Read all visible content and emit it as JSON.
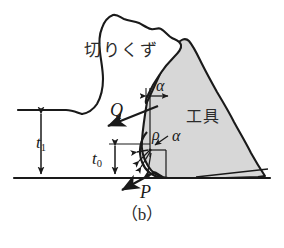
{
  "figure": {
    "caption": "（b）",
    "domain_type": "technical-diagram",
    "background_color": "#ffffff",
    "line_color": "#1a1a1a",
    "tool_fill_color": "#d7d7d7",
    "chip_fill_color": "#ffffff"
  },
  "labels": {
    "chip": "切りくず",
    "tool": "工具",
    "force_Q": "Q",
    "force_P": "P",
    "depth_t1": "t",
    "depth_t1_sub": "1",
    "depth_t0": "t",
    "depth_t0_sub": "0",
    "angle_alpha_top": "α",
    "angle_alpha_mid": "α",
    "radius_rho": "ρ"
  },
  "annotations": {
    "alpha_top_description": "rake angle measured between vertical reference line and tool rake face",
    "alpha_mid_description": "angle at the rounded cutting edge centre",
    "rho_description": "cutting edge nose radius",
    "t1_description": "uncut chip thickness from workpiece top surface to machined surface",
    "t0_description": "depth from tool edge centre height to machined surface",
    "Q_description": "resultant force arrow on the rake face directed up-left",
    "P_description": "force arrow at the cutting edge directed down-left"
  },
  "geometry": {
    "chip_outline": "M 24,116 L 80,116 L 92,112 L 100,100 L 104,82 L 102,60 L 98,38 L 104,22 L 112,14 L 120,18 L 130,20 L 140,24 L 150,26 L 156,32 L 162,30 L 170,36 L 176,38 L 180,44 L 172,52 L 166,60 L 160,68 L 152,78 L 148,90 L 146,100",
    "tool_outline": "M 147,101 L 158,80 L 168,58 L 178,44 L 186,40 L 194,48 L 204,62 L 212,74 L 222,86 L 232,100 L 240,116 L 250,132 L 256,146 L 262,160 L 266,172 L 258,174 L 230,176 L 196,178 L 172,178 L 158,176 L 150,170 L 144,160 L 142,148 L 143,134 L 146,118 Z",
    "workpiece_top_surface_y": 110,
    "machined_surface_y": 178,
    "tool_edge_center": [
      150,
      148
    ],
    "nose_radius_px": 18
  }
}
